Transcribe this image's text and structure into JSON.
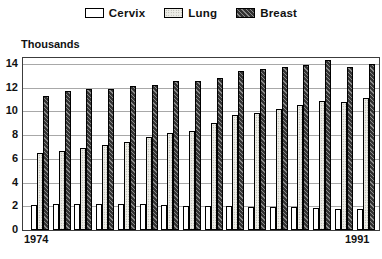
{
  "chart_data": {
    "type": "bar",
    "title": "",
    "ylabel": "Thousands",
    "xlabel": "",
    "x_first_label": "1974",
    "x_last_label": "1991",
    "n_groups": 16,
    "ylim": [
      0,
      14.5
    ],
    "yticks": [
      0,
      2,
      4,
      6,
      8,
      10,
      12,
      14
    ],
    "grid": "horizontal-gray-lines",
    "legend_position": "top-center",
    "series": [
      {
        "name": "Cervix",
        "pattern": "white-solid-black-outline",
        "values": [
          2.1,
          2.2,
          2.2,
          2.2,
          2.15,
          2.15,
          2.1,
          2.05,
          2.0,
          2.0,
          1.95,
          1.9,
          1.9,
          1.85,
          1.8,
          1.75
        ]
      },
      {
        "name": "Lung",
        "pattern": "light-gray-stipple-dots",
        "values": [
          6.5,
          6.7,
          6.95,
          7.2,
          7.45,
          7.8,
          8.2,
          8.35,
          9.0,
          9.7,
          9.85,
          10.2,
          10.5,
          10.85,
          10.8,
          11.1
        ]
      },
      {
        "name": "Breast",
        "pattern": "dark-gray-diagonal-hatch",
        "values": [
          11.3,
          11.75,
          11.9,
          11.9,
          12.1,
          12.25,
          12.6,
          12.55,
          12.85,
          13.4,
          13.6,
          13.75,
          13.9,
          14.3,
          13.75,
          14.0
        ]
      }
    ],
    "colors": {
      "text": "#111111",
      "frame": "#3c3c3c",
      "gridline": "#a8a8a8",
      "bar_outline": "#000000",
      "lung_fill": "#ecece6",
      "breast_dark": "#333333",
      "breast_hatch_light": "#8a8a8a"
    }
  }
}
